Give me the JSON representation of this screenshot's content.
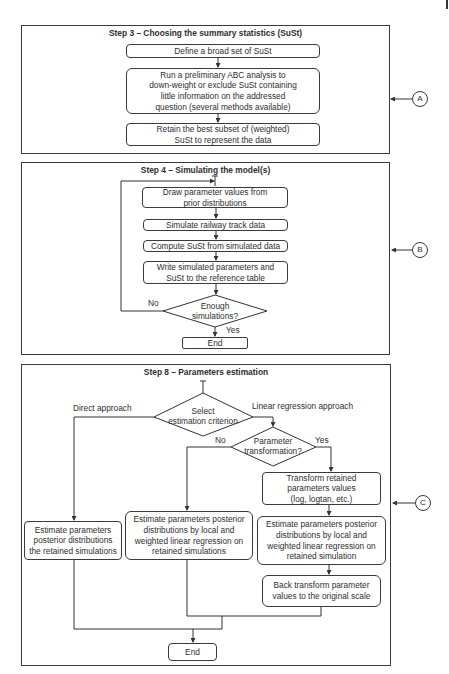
{
  "step3": {
    "title": "Step 3 – Choosing the summary statistics (SuSt)",
    "boxes": [
      "Define a broad set of SuSt",
      "Run a preliminary ABC analysis to\ndown-weight or exclude SuSt containing\nlittle information on the addressed\nquestion (several methods available)",
      "Retain the best subset of (weighted)\nSuSt to represent the data"
    ],
    "marker": "A"
  },
  "step4": {
    "title": "Step 4 – Simulating the model(s)",
    "boxes": [
      "Draw parameter values from\nprior distributions",
      "Simulate railway track data",
      "Compute SuSt from simulated data",
      "Write simulated parameters and\nSuSt to the reference table"
    ],
    "decision": "Enough\nsimulations?",
    "no_label": "No",
    "yes_label": "Yes",
    "end": "End",
    "marker": "B"
  },
  "step8": {
    "title": "Step 8 – Parameters estimation",
    "decision_criterion": "Select\nestimation criterion",
    "direct_label": "Direct approach",
    "linear_label": "Linear regression approach",
    "decision_transform": "Parameter\ntransformation?",
    "no_label": "No",
    "yes_label": "Yes",
    "transform_box": "Transform retained\nparameters values\n(log, logtan, etc.)",
    "direct_box": "Estimate parameters\nposterior distributions\nthe retained simulations",
    "linear_no_box": "Estimate parameters posterior\ndistributions by local and\nweighted linear regression on\nretained simulations",
    "linear_yes_box": "Estimate parameters posterior\ndistributions by local and\nweighted linear regression on\nretained simulation",
    "back_transform_box": "Back transform parameter\nvalues to the original scale",
    "end": "End",
    "marker": "C"
  }
}
